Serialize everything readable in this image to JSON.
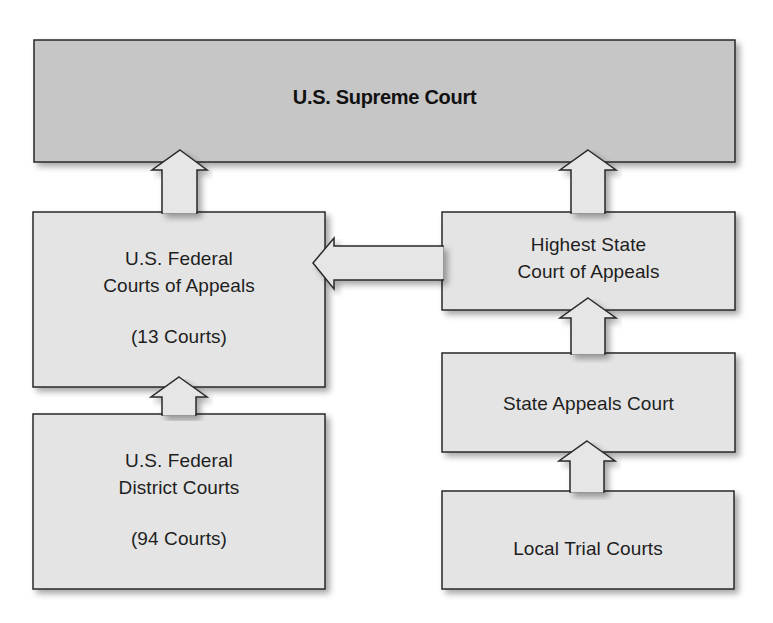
{
  "colors": {
    "top_box_fill": "#c6c6c6",
    "box_fill": "#e4e4e4",
    "arrow_fill": "#e6e6e6",
    "stroke": "#2a2a2a",
    "text": "#1e1e1e",
    "background": "#ffffff"
  },
  "nodes": {
    "supreme": {
      "label": "U.S. Supreme Court"
    },
    "federal_appeals": {
      "line1": "U.S. Federal",
      "line2": "Courts of Appeals",
      "count": "(13 Courts)"
    },
    "federal_district": {
      "line1": "U.S. Federal",
      "line2": "District Courts",
      "count": "(94 Courts)"
    },
    "highest_state": {
      "line1": "Highest State",
      "line2": "Court of Appeals"
    },
    "state_appeals": {
      "label": "State Appeals Court"
    },
    "local_trial": {
      "label": "Local Trial Courts"
    }
  },
  "edges": [
    {
      "from": "U.S. Federal Courts of Appeals",
      "to": "U.S. Supreme Court",
      "direction": "up"
    },
    {
      "from": "Highest State Court of Appeals",
      "to": "U.S. Supreme Court",
      "direction": "up"
    },
    {
      "from": "Highest State Court of Appeals",
      "to": "U.S. Federal Courts of Appeals",
      "direction": "left"
    },
    {
      "from": "U.S. Federal District Courts",
      "to": "U.S. Federal Courts of Appeals",
      "direction": "up"
    },
    {
      "from": "State Appeals Court",
      "to": "Highest State Court of Appeals",
      "direction": "up"
    },
    {
      "from": "Local Trial Courts",
      "to": "State Appeals Court",
      "direction": "up"
    }
  ]
}
